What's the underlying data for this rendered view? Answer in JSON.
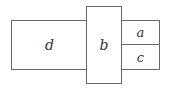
{
  "diagram": {
    "type": "rectangle-arrangement",
    "boxes": [
      {
        "id": "d",
        "label": "d"
      },
      {
        "id": "b",
        "label": "b"
      },
      {
        "id": "a",
        "label": "a"
      },
      {
        "id": "c",
        "label": "c"
      }
    ],
    "stroke_color": "#6a6a6a"
  }
}
